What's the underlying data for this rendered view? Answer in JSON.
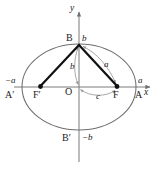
{
  "figure": {
    "kind": "ellipse-geometry-diagram",
    "colors": {
      "background": "#ffffff",
      "axis": "#7a7a7a",
      "ellipse": "#6e6e6e",
      "dimension_arc": "#9a9a9a",
      "focal_radius": "#111111",
      "focus_dot": "#111111",
      "text": "#1b1b1b"
    },
    "axes": {
      "x_label": "x",
      "y_label": "y",
      "origin_label": "O"
    },
    "vertices": {
      "right_major": "A",
      "left_major": "A′",
      "top_minor": "B",
      "bottom_minor": "B′"
    },
    "foci": {
      "right": "F",
      "left": "F′"
    },
    "axis_values": {
      "right_major_value": "a",
      "left_major_value": "−a",
      "top_minor_value": "b",
      "bottom_minor_value": "−b"
    },
    "measures": {
      "semi_minor": "b",
      "focal_radius": "a",
      "focal_distance": "c"
    },
    "geometry": {
      "center_x": 79,
      "center_y": 87,
      "semi_major_px": 57,
      "semi_minor_px": 43,
      "focus_offset_px": 38,
      "x_axis_start": 14,
      "x_axis_end": 152,
      "y_axis_top": 10,
      "y_axis_bottom": 162
    }
  }
}
